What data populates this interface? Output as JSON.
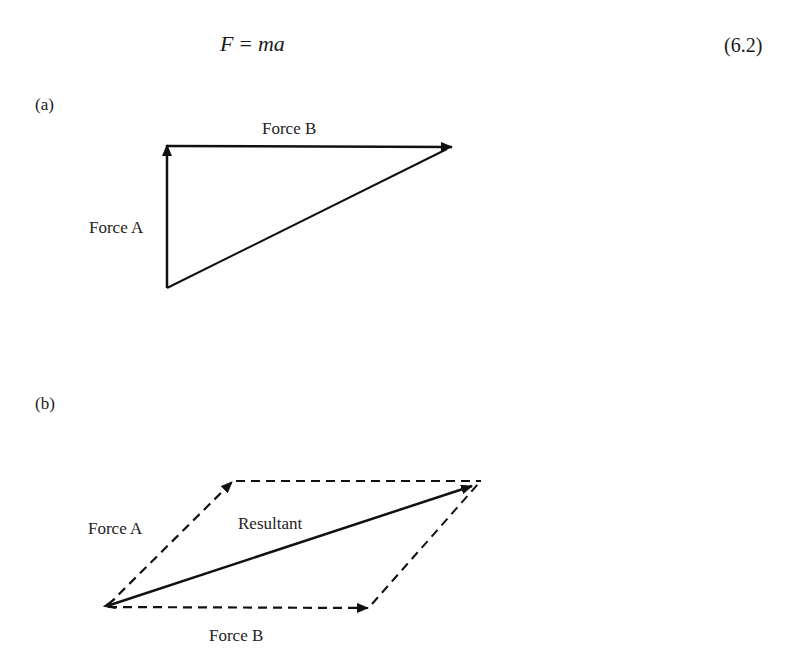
{
  "equation": {
    "lhs": "F",
    "operator": "=",
    "rhs": "ma",
    "number": "(6.2)"
  },
  "part_a": {
    "label": "(a)",
    "vectors": [
      {
        "name": "Force A",
        "label": "Force A",
        "style": "solid",
        "from": [
          167,
          288
        ],
        "to": [
          167,
          144
        ]
      },
      {
        "name": "Force B",
        "label": "Force B",
        "style": "solid",
        "from": [
          167,
          146
        ],
        "to": [
          452,
          147
        ]
      },
      {
        "name": "closing side",
        "label": "",
        "style": "solid",
        "from": [
          167,
          288
        ],
        "to": [
          448,
          148
        ]
      }
    ]
  },
  "part_b": {
    "label": "(b)",
    "vectors": [
      {
        "name": "Force A",
        "label": "Force A",
        "style": "dashed",
        "from": [
          107,
          606
        ],
        "to": [
          232,
          482
        ]
      },
      {
        "name": "Force B",
        "label": "Force B",
        "style": "dashed",
        "from": [
          107,
          607
        ],
        "to": [
          368,
          608
        ]
      },
      {
        "name": "Resultant",
        "label": "Resultant",
        "style": "solid",
        "from": [
          107,
          606
        ],
        "to": [
          472,
          486
        ]
      },
      {
        "name": "top side",
        "label": "",
        "style": "dashed",
        "from": [
          234,
          481
        ],
        "to": [
          481,
          481
        ]
      },
      {
        "name": "right side",
        "label": "",
        "style": "dashed",
        "from": [
          372,
          604
        ],
        "to": [
          478,
          484
        ]
      }
    ]
  },
  "colors": {
    "line": "#111111",
    "text": "#1a1a1a",
    "background": "#ffffff"
  }
}
